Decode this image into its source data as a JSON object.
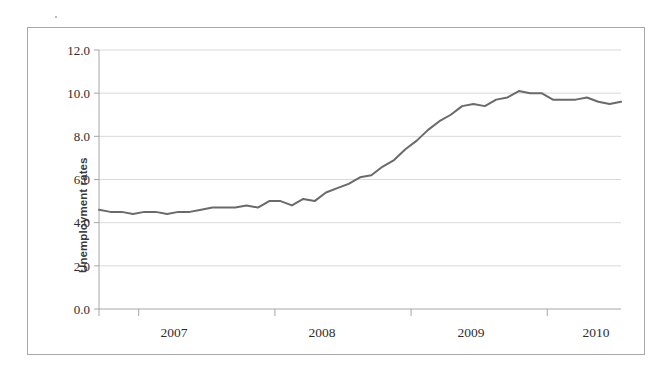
{
  "chart_data": {
    "type": "line",
    "title": "",
    "xlabel": "",
    "ylabel": "Unemployment rates",
    "ylim": [
      0.0,
      12.0
    ],
    "ytick_labels": [
      "12.0",
      "10.0",
      "8.0",
      "6.0",
      "4.0",
      "2.0",
      "0.0"
    ],
    "ytick_values": [
      12.0,
      10.0,
      8.0,
      6.0,
      4.0,
      2.0,
      0.0
    ],
    "xtick_labels": [
      "2007",
      "2008",
      "2009",
      "2010"
    ],
    "grid": "horizontal",
    "legend": "none",
    "series": [
      {
        "name": "Unemployment rate",
        "color": "#6a6a6a",
        "x": [
          "2006-09",
          "2006-10",
          "2006-11",
          "2006-12",
          "2007-01",
          "2007-02",
          "2007-03",
          "2007-04",
          "2007-05",
          "2007-06",
          "2007-07",
          "2007-08",
          "2007-09",
          "2007-10",
          "2007-11",
          "2007-12",
          "2008-01",
          "2008-02",
          "2008-03",
          "2008-04",
          "2008-05",
          "2008-06",
          "2008-07",
          "2008-08",
          "2008-09",
          "2008-10",
          "2008-11",
          "2008-12",
          "2009-01",
          "2009-02",
          "2009-03",
          "2009-04",
          "2009-05",
          "2009-06",
          "2009-07",
          "2009-08",
          "2009-09",
          "2009-10",
          "2009-11",
          "2009-12",
          "2010-01",
          "2010-02",
          "2010-03",
          "2010-04",
          "2010-05",
          "2010-06",
          "2010-07"
        ],
        "values": [
          4.6,
          4.5,
          4.5,
          4.4,
          4.5,
          4.5,
          4.4,
          4.5,
          4.5,
          4.6,
          4.7,
          4.7,
          4.7,
          4.8,
          4.7,
          5.0,
          5.0,
          4.8,
          5.1,
          5.0,
          5.4,
          5.6,
          5.8,
          6.1,
          6.2,
          6.6,
          6.9,
          7.4,
          7.8,
          8.3,
          8.7,
          9.0,
          9.4,
          9.5,
          9.4,
          9.7,
          9.8,
          10.1,
          10.0,
          10.0,
          9.7,
          9.7,
          9.7,
          9.8,
          9.6,
          9.5,
          9.6
        ]
      }
    ]
  },
  "axis": {
    "y_title": "Unemployment rates",
    "y_ticks": [
      "12.0",
      "10.0",
      "8.0",
      "6.0",
      "4.0",
      "2.0",
      "0.0"
    ],
    "x_ticks": [
      "2007",
      "2008",
      "2009",
      "2010"
    ]
  },
  "colors": {
    "line": "#6a6a6a",
    "grid": "#d9d9d9",
    "axis": "#a6a6a6",
    "frame": "#a8a8a8",
    "text": "#2e2e2e"
  }
}
